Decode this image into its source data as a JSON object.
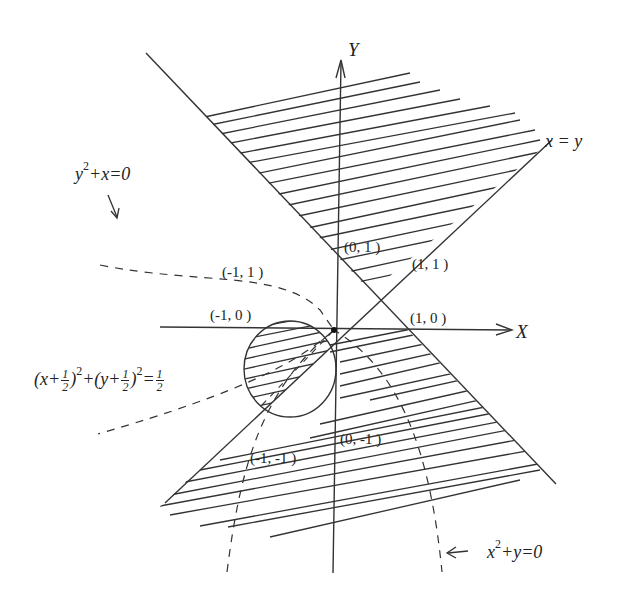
{
  "diagram": {
    "colors": {
      "stroke": "#333333",
      "background": "#ffffff"
    },
    "axes": {
      "x_label": "X",
      "y_label": "Y",
      "origin_px": [
        334,
        330
      ],
      "x_axis_px": [
        [
          160,
          327
        ],
        [
          512,
          330
        ]
      ],
      "y_axis_px": [
        [
          333,
          573
        ],
        [
          341,
          62
        ]
      ]
    },
    "lines": [
      {
        "name": "x-plus-y-equals-1",
        "from": [
          146,
          53
        ],
        "to": [
          556,
          484
        ]
      },
      {
        "name": "x-equals-y",
        "label": "x = y",
        "from": [
          165,
          503
        ],
        "to": [
          552,
          140
        ]
      }
    ],
    "circle": {
      "equation_parts": {
        "open1": "(x+",
        "frac_n": "1",
        "frac_d": "2",
        "close1": ")",
        "exp": "2",
        "plus": "+(y+",
        "close2": ")",
        "equals": "=",
        "rhs_n": "1",
        "rhs_d": "2"
      },
      "center_px": [
        290,
        369
      ],
      "rx": 46,
      "ry": 48
    },
    "curves": [
      {
        "name": "parabola-y2-plus-x",
        "label_base": "y",
        "label_exp": "2",
        "label_rest": "+x=0"
      },
      {
        "name": "parabola-x2-plus-y",
        "label_base": "x",
        "label_exp": "2",
        "label_rest": "+y=0",
        "arrow": "←"
      }
    ],
    "points": [
      {
        "text": "(0, 1 )",
        "x": 344,
        "y": 240
      },
      {
        "text": "(1, 1 )",
        "x": 412,
        "y": 257
      },
      {
        "text": "(-1, 1 )",
        "x": 222,
        "y": 265
      },
      {
        "text": "(-1, 0 )",
        "x": 210,
        "y": 308
      },
      {
        "text": "(1, 0 )",
        "x": 410,
        "y": 311
      },
      {
        "text": "(0, -1 )",
        "x": 340,
        "y": 432
      },
      {
        "text": "(-1, -1 )",
        "x": 250,
        "y": 451
      }
    ]
  }
}
